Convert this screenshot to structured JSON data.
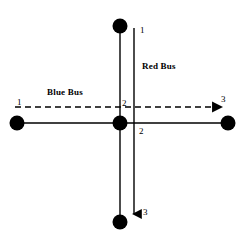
{
  "figure": {
    "background_color": "#ffffff",
    "stroke_color": "#000000",
    "node_color": "#000000"
  },
  "labels": {
    "red_bus": "Red Bus",
    "blue_bus": "Blue Bus",
    "red_start": "1",
    "red_middle": "2",
    "red_end": "3",
    "blue_start": "1",
    "blue_middle": "2",
    "blue_end": "3"
  },
  "routes": [
    {
      "name": "Red Bus",
      "style": "solid-arrow",
      "orientation": "vertical",
      "stops": [
        "1",
        "2",
        "3"
      ],
      "direction": "downward"
    },
    {
      "name": "Blue Bus",
      "style": "dashed-arrow",
      "orientation": "horizontal",
      "stops": [
        "1",
        "2",
        "3"
      ],
      "direction": "rightward"
    }
  ],
  "nodes": [
    {
      "name": "top-node",
      "x": 120,
      "y": 26
    },
    {
      "name": "left-node",
      "x": 17,
      "y": 123
    },
    {
      "name": "center-node",
      "x": 120,
      "y": 123
    },
    {
      "name": "right-node",
      "x": 228,
      "y": 123
    },
    {
      "name": "bottom-node",
      "x": 120,
      "y": 222
    }
  ]
}
